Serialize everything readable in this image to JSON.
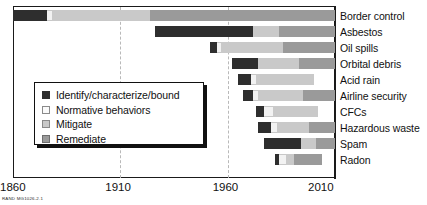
{
  "chart_data": {
    "type": "bar",
    "orientation": "horizontal-stacked-timeline",
    "title": "",
    "xlabel": "",
    "ylabel": "",
    "xlim": [
      1860,
      2010
    ],
    "xticks": [
      1860,
      1910,
      1960,
      2010
    ],
    "xtick_labels": [
      "1860",
      "1910",
      "1960",
      "2010"
    ],
    "gridlines": [
      1910,
      1960
    ],
    "grid": true,
    "legend_position": "inside-left",
    "series": [
      {
        "name": "Identify/characterize/bound",
        "key": "identify",
        "color": "#2e2e2e"
      },
      {
        "name": "Normative behaviors",
        "key": "normative",
        "color": "#f2f2f2"
      },
      {
        "name": "Mitigate",
        "key": "mitigate",
        "color": "#c9c9c9"
      },
      {
        "name": "Remediate",
        "key": "remediate",
        "color": "#9a9a9a"
      }
    ],
    "categories": [
      "Border control",
      "Asbestos",
      "Oil spills",
      "Orbital debris",
      "Acid rain",
      "Airline security",
      "CFCs",
      "Hazardous waste",
      "Spam",
      "Radon"
    ],
    "rows": [
      {
        "category": "Border control",
        "start": 1860,
        "end": 2010,
        "segments": [
          {
            "phase": "identify",
            "start": 1860,
            "end": 1876
          },
          {
            "phase": "normative",
            "start": 1876,
            "end": 1878
          },
          {
            "phase": "mitigate",
            "start": 1878,
            "end": 1924
          },
          {
            "phase": "remediate",
            "start": 1924,
            "end": 2010
          }
        ]
      },
      {
        "category": "Asbestos",
        "start": 1926,
        "end": 2010,
        "segments": [
          {
            "phase": "identify",
            "start": 1926,
            "end": 1972
          },
          {
            "phase": "mitigate",
            "start": 1972,
            "end": 1984
          },
          {
            "phase": "remediate",
            "start": 1984,
            "end": 2010
          }
        ]
      },
      {
        "category": "Oil spills",
        "start": 1952,
        "end": 2010,
        "segments": [
          {
            "phase": "identify",
            "start": 1952,
            "end": 1955
          },
          {
            "phase": "normative",
            "start": 1955,
            "end": 1957
          },
          {
            "phase": "mitigate",
            "start": 1957,
            "end": 1986
          },
          {
            "phase": "remediate",
            "start": 1986,
            "end": 2010
          }
        ]
      },
      {
        "category": "Orbital debris",
        "start": 1962,
        "end": 2010,
        "segments": [
          {
            "phase": "identify",
            "start": 1962,
            "end": 1974
          },
          {
            "phase": "mitigate",
            "start": 1974,
            "end": 1993
          },
          {
            "phase": "remediate",
            "start": 1993,
            "end": 2010
          }
        ]
      },
      {
        "category": "Acid rain",
        "start": 1965,
        "end": 2000,
        "segments": [
          {
            "phase": "identify",
            "start": 1965,
            "end": 1971
          },
          {
            "phase": "normative",
            "start": 1971,
            "end": 1973
          },
          {
            "phase": "mitigate",
            "start": 1973,
            "end": 2000
          }
        ]
      },
      {
        "category": "Airline security",
        "start": 1967,
        "end": 2010,
        "segments": [
          {
            "phase": "identify",
            "start": 1967,
            "end": 1972
          },
          {
            "phase": "normative",
            "start": 1972,
            "end": 1974
          },
          {
            "phase": "mitigate",
            "start": 1974,
            "end": 1995
          },
          {
            "phase": "remediate",
            "start": 1995,
            "end": 2010
          }
        ]
      },
      {
        "category": "CFCs",
        "start": 1973,
        "end": 2002,
        "segments": [
          {
            "phase": "identify",
            "start": 1973,
            "end": 1977
          },
          {
            "phase": "normative",
            "start": 1977,
            "end": 1981
          },
          {
            "phase": "mitigate",
            "start": 1981,
            "end": 2002
          }
        ]
      },
      {
        "category": "Hazardous waste",
        "start": 1974,
        "end": 2010,
        "segments": [
          {
            "phase": "identify",
            "start": 1974,
            "end": 1980
          },
          {
            "phase": "normative",
            "start": 1980,
            "end": 1983
          },
          {
            "phase": "mitigate",
            "start": 1983,
            "end": 1998
          },
          {
            "phase": "remediate",
            "start": 1998,
            "end": 2010
          }
        ]
      },
      {
        "category": "Spam",
        "start": 1977,
        "end": 2010,
        "segments": [
          {
            "phase": "identify",
            "start": 1977,
            "end": 1994
          },
          {
            "phase": "mitigate",
            "start": 1994,
            "end": 2001
          },
          {
            "phase": "remediate",
            "start": 2001,
            "end": 2010
          }
        ]
      },
      {
        "category": "Radon",
        "start": 1982,
        "end": 2004,
        "segments": [
          {
            "phase": "identify",
            "start": 1982,
            "end": 1984
          },
          {
            "phase": "normative",
            "start": 1984,
            "end": 1987
          },
          {
            "phase": "mitigate",
            "start": 1987,
            "end": 1991
          },
          {
            "phase": "remediate",
            "start": 1991,
            "end": 2004
          }
        ]
      }
    ]
  },
  "legend": {
    "items": [
      {
        "label": "Identify/characterize/bound",
        "swatch": "identify"
      },
      {
        "label": "Normative behaviors",
        "swatch": "normative"
      },
      {
        "label": "Mitigate",
        "swatch": "mitigate"
      },
      {
        "label": "Remediate",
        "swatch": "remediate"
      }
    ]
  },
  "source_credit": "RAND MG1026-2.1",
  "colors": {
    "identify": "#2e2e2e",
    "normative": "#f2f2f2",
    "mitigate": "#c9c9c9",
    "remediate": "#9a9a9a",
    "axis": "#1a1a1a",
    "grid": "#b9b9b9"
  }
}
